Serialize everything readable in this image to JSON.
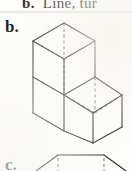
{
  "page": {
    "background_color": "#fdfdfb",
    "ink_color": "#2a2a2a",
    "hidden_edge_color": "#6d6d6d",
    "width": 132,
    "height": 171
  },
  "header": {
    "cutoff_text_bold": "b.",
    "cutoff_text_rest": "Line, tur"
  },
  "items": [
    {
      "label": "b.",
      "figure_type": "isometric-cube-assembly",
      "cube_count": 3,
      "arrangement": "staircase: one cube on top-left, two cubes in bottom row extending right",
      "edge_style_visible": "solid",
      "edge_style_hidden": "dashed"
    },
    {
      "label": "c.",
      "figure_type": "isometric-cube-assembly",
      "arrangement": "partially visible, clipped at bottom of image",
      "edge_style_visible": "solid",
      "edge_style_hidden": "dashed"
    }
  ],
  "figure_b_geometry": {
    "unit_half_width": 31,
    "unit_half_height": 18,
    "unit_vertical": 36,
    "description": "Isometric drawing of three unit cubes. Upper cube sits on the left cube of a two-cube bottom row.",
    "key_vertices": {
      "top_apex": [
        64,
        23
      ],
      "top_left": [
        33,
        41
      ],
      "top_right": [
        95,
        41
      ],
      "center_junction": [
        64,
        87
      ],
      "left_lower": [
        33,
        77
      ],
      "right_lower": [
        95,
        77
      ],
      "bottom_vertex": [
        93,
        143
      ],
      "far_right": [
        122,
        95
      ]
    }
  }
}
